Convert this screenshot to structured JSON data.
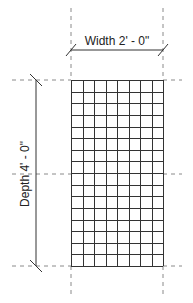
{
  "diagram": {
    "type": "dimensioned-grid-plan",
    "width_label": "Width 2' - 0\"",
    "depth_label": "Depth 4' - 0\"",
    "grid": {
      "columns": 8,
      "rows": 16,
      "left": 71,
      "top": 80,
      "right": 163,
      "bottom": 266
    },
    "colors": {
      "line": "#333333",
      "dashed": "#888888",
      "background": "#ffffff"
    }
  }
}
